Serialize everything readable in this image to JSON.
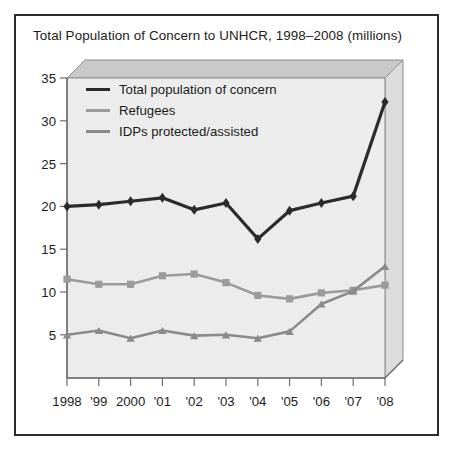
{
  "chart_data": {
    "type": "line",
    "title": "Total Population of Concern to UNHCR, 1998–2008 (millions)",
    "xlabel": "",
    "ylabel": "",
    "ylim": [
      0,
      35
    ],
    "yticks": [
      5,
      10,
      15,
      20,
      25,
      30,
      35
    ],
    "grid": false,
    "legend_position": "top-left",
    "categories": [
      "1998",
      "'99",
      "2000",
      "'01",
      "'02",
      "'03",
      "'04",
      "'05",
      "'06",
      "'07",
      "'08"
    ],
    "x": [
      1998,
      1999,
      2000,
      2001,
      2002,
      2003,
      2004,
      2005,
      2006,
      2007,
      2008
    ],
    "series": [
      {
        "name": "Total population of concern",
        "color": "#2b2b2b",
        "marker": "diamond",
        "values": [
          20.0,
          20.2,
          20.6,
          21.0,
          19.6,
          20.4,
          16.2,
          19.5,
          20.4,
          21.2,
          32.2
        ]
      },
      {
        "name": "Refugees",
        "color": "#9b9b9b",
        "marker": "square",
        "values": [
          11.5,
          10.9,
          10.9,
          11.9,
          12.1,
          11.1,
          9.6,
          9.2,
          9.9,
          10.2,
          10.8
        ]
      },
      {
        "name": "IDPs protected/assisted",
        "color": "#8a8a8a",
        "marker": "triangle",
        "values": [
          5.0,
          5.5,
          4.6,
          5.5,
          4.9,
          5.0,
          4.6,
          5.4,
          8.6,
          10.1,
          13.0
        ]
      }
    ]
  },
  "legend": {
    "items": [
      {
        "label": "Total population of concern",
        "color": "#2b2b2b"
      },
      {
        "label": "Refugees",
        "color": "#9b9b9b"
      },
      {
        "label": "IDPs protected/assisted",
        "color": "#8a8a8a"
      }
    ]
  },
  "axes": {
    "y_labels": [
      "35",
      "30",
      "25",
      "20",
      "15",
      "10",
      "5"
    ],
    "x_labels": [
      "1998",
      "'99",
      "2000",
      "'01",
      "'02",
      "'03",
      "'04",
      "'05",
      "'06",
      "'07",
      "'08"
    ]
  },
  "colors": {
    "frame_border": "#2b2b2b",
    "plot_background": "#ececec",
    "wall_top": "#c9c9c9",
    "wall_right": "#dcdcdc",
    "axis": "#6e6e6e",
    "text": "#1b1b1b"
  }
}
